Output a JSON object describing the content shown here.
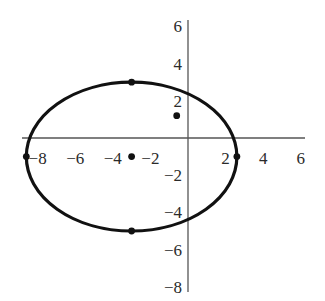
{
  "chart_data": {
    "type": "scatter",
    "title": "",
    "xlabel": "",
    "ylabel": "",
    "xlim": [
      -9,
      6.5
    ],
    "ylim": [
      -8.5,
      6.5
    ],
    "grid": false,
    "x_ticks": [
      "-8",
      "-6",
      "-4",
      "-2",
      "2",
      "4",
      "6"
    ],
    "y_ticks": [
      "6",
      "4",
      "2",
      "-2",
      "-4",
      "-6",
      "-8"
    ],
    "curve": {
      "kind": "ellipse",
      "center": [
        -3,
        -1
      ],
      "semi_axis_x": 5.6,
      "semi_axis_y": 4
    },
    "points": [
      {
        "name": "center",
        "x": -3,
        "y": -1
      },
      {
        "name": "top-vertex",
        "x": -3,
        "y": 3
      },
      {
        "name": "bottom-vertex",
        "x": -3,
        "y": -5
      },
      {
        "name": "left-vertex",
        "x": -8.6,
        "y": -1
      },
      {
        "name": "right-vertex",
        "x": 2.6,
        "y": -1
      },
      {
        "name": "isolated-point",
        "x": -0.6,
        "y": 1.2
      }
    ]
  },
  "axes": {
    "x_labels": [
      {
        "text": "-8",
        "v": -8
      },
      {
        "text": "-6",
        "v": -6
      },
      {
        "text": "-4",
        "v": -4
      },
      {
        "text": "-2",
        "v": -2
      },
      {
        "text": "2",
        "v": 2
      },
      {
        "text": "4",
        "v": 4
      },
      {
        "text": "6",
        "v": 6
      }
    ],
    "y_labels": [
      {
        "text": "6",
        "v": 6
      },
      {
        "text": "4",
        "v": 4
      },
      {
        "text": "2",
        "v": 2
      },
      {
        "text": "-2",
        "v": -2
      },
      {
        "text": "-4",
        "v": -4
      },
      {
        "text": "-6",
        "v": -6
      },
      {
        "text": "-8",
        "v": -8
      }
    ]
  },
  "style": {
    "axis_color": "#555555",
    "curve_color": "#111111",
    "point_color": "#111111"
  }
}
